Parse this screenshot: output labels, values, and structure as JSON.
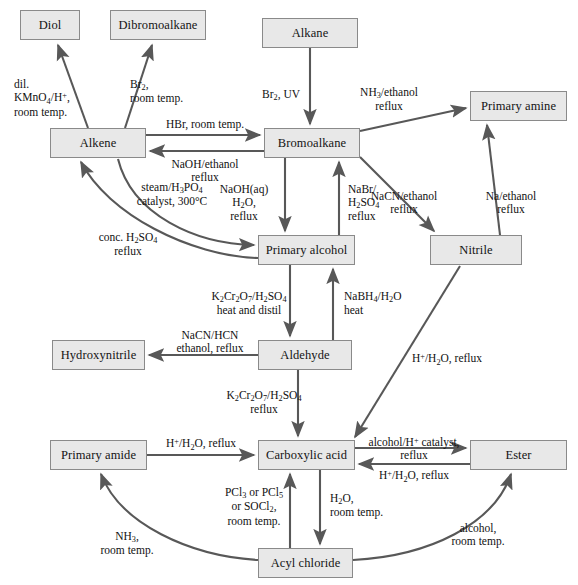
{
  "diagram": {
    "box_fill": "#e8e8e8",
    "box_stroke": "#8a8a8a",
    "arrow_color": "#585858",
    "text_color": "#141414"
  },
  "nodes": [
    {
      "id": "diol",
      "label": "Diol",
      "x": 20,
      "y": 10,
      "w": 60,
      "h": 30
    },
    {
      "id": "dibromoalkane",
      "label": "Dibromoalkane",
      "x": 110,
      "y": 10,
      "w": 96,
      "h": 30
    },
    {
      "id": "alkane",
      "label": "Alkane",
      "x": 262,
      "y": 18,
      "w": 96,
      "h": 30
    },
    {
      "id": "primary-amine",
      "label": "Primary amine",
      "x": 470,
      "y": 91,
      "w": 97,
      "h": 30
    },
    {
      "id": "alkene",
      "label": "Alkene",
      "x": 50,
      "y": 128,
      "w": 96,
      "h": 30
    },
    {
      "id": "bromoalkane",
      "label": "Bromoalkane",
      "x": 264,
      "y": 128,
      "w": 96,
      "h": 30
    },
    {
      "id": "primary-alcohol",
      "label": "Primary alcohol",
      "x": 258,
      "y": 235,
      "w": 97,
      "h": 30
    },
    {
      "id": "nitrile",
      "label": "Nitrile",
      "x": 430,
      "y": 235,
      "w": 92,
      "h": 30
    },
    {
      "id": "hydroxynitrile",
      "label": "Hydroxynitrile",
      "x": 52,
      "y": 340,
      "w": 93,
      "h": 30
    },
    {
      "id": "aldehyde",
      "label": "Aldehyde",
      "x": 258,
      "y": 340,
      "w": 94,
      "h": 30
    },
    {
      "id": "primary-amide",
      "label": "Primary amide",
      "x": 50,
      "y": 440,
      "w": 97,
      "h": 30
    },
    {
      "id": "carboxylic-acid",
      "label": "Carboxylic acid",
      "x": 258,
      "y": 440,
      "w": 97,
      "h": 30
    },
    {
      "id": "ester",
      "label": "Ester",
      "x": 470,
      "y": 440,
      "w": 97,
      "h": 30
    },
    {
      "id": "acyl-chloride",
      "label": "Acyl chloride",
      "x": 258,
      "y": 548,
      "w": 95,
      "h": 30
    }
  ],
  "reactions": [
    {
      "id": "alkene-to-diol",
      "from": "alkene",
      "to": "diol",
      "reagent_lines": [
        "dil.",
        "KMnO4/H+,",
        "room temp."
      ]
    },
    {
      "id": "alkene-to-dibromoalkane",
      "from": "alkene",
      "to": "dibromoalkane",
      "reagent_lines": [
        "Br2,",
        "room temp."
      ]
    },
    {
      "id": "alkane-to-bromoalkane",
      "from": "alkane",
      "to": "bromoalkane",
      "reagent_lines": [
        "Br2, UV"
      ]
    },
    {
      "id": "alkene-to-bromoalkane",
      "from": "alkene",
      "to": "bromoalkane",
      "reagent_lines": [
        "HBr, room temp."
      ]
    },
    {
      "id": "bromoalkane-to-alkene",
      "from": "bromoalkane",
      "to": "alkene",
      "reagent_lines": [
        "NaOH/ethanol",
        "reflux"
      ]
    },
    {
      "id": "bromoalkane-to-amine",
      "from": "bromoalkane",
      "to": "primary-amine",
      "reagent_lines": [
        "NH3/ethanol",
        "reflux"
      ]
    },
    {
      "id": "bromoalkane-to-nitrile",
      "from": "bromoalkane",
      "to": "nitrile",
      "reagent_lines": [
        "NaCN/ethanol",
        "reflux"
      ]
    },
    {
      "id": "nitrile-to-amine",
      "from": "nitrile",
      "to": "primary-amine",
      "reagent_lines": [
        "Na/ethanol",
        "reflux"
      ]
    },
    {
      "id": "bromoalkane-to-alcohol",
      "from": "bromoalkane",
      "to": "primary-alcohol",
      "reagent_lines": [
        "NaOH(aq)",
        "H2O,",
        "reflux"
      ]
    },
    {
      "id": "alcohol-to-bromoalkane",
      "from": "primary-alcohol",
      "to": "bromoalkane",
      "reagent_lines": [
        "NaBr/",
        "H2SO4",
        "reflux"
      ]
    },
    {
      "id": "alcohol-to-alkene",
      "from": "primary-alcohol",
      "to": "alkene",
      "reagent_lines": [
        "conc. H2SO4",
        "reflux"
      ]
    },
    {
      "id": "alkene-to-alcohol",
      "from": "alkene",
      "to": "primary-alcohol",
      "reagent_lines": [
        "steam/H3PO4",
        "catalyst, 300°C"
      ]
    },
    {
      "id": "alcohol-to-aldehyde",
      "from": "primary-alcohol",
      "to": "aldehyde",
      "reagent_lines": [
        "K2Cr2O7/H2SO4",
        "heat and distil"
      ]
    },
    {
      "id": "aldehyde-to-alcohol",
      "from": "aldehyde",
      "to": "primary-alcohol",
      "reagent_lines": [
        "NaBH4/H2O",
        "heat"
      ]
    },
    {
      "id": "aldehyde-to-hydroxynitrile",
      "from": "aldehyde",
      "to": "hydroxynitrile",
      "reagent_lines": [
        "NaCN/HCN",
        "ethanol, reflux"
      ]
    },
    {
      "id": "aldehyde-to-acid",
      "from": "aldehyde",
      "to": "carboxylic-acid",
      "reagent_lines": [
        "K2Cr2O7/H2SO4",
        "reflux"
      ]
    },
    {
      "id": "nitrile-to-acid",
      "from": "nitrile",
      "to": "carboxylic-acid",
      "reagent_lines": [
        "H+/H2O, reflux"
      ]
    },
    {
      "id": "amide-to-acid",
      "from": "primary-amide",
      "to": "carboxylic-acid",
      "reagent_lines": [
        "H+/H2O, reflux"
      ]
    },
    {
      "id": "acid-to-ester",
      "from": "carboxylic-acid",
      "to": "ester",
      "reagent_lines": [
        "alcohol/H+ catalyst,",
        "reflux"
      ]
    },
    {
      "id": "ester-to-acid",
      "from": "ester",
      "to": "carboxylic-acid",
      "reagent_lines": [
        "H+/H2O, reflux"
      ]
    },
    {
      "id": "acid-to-acyl-chloride",
      "from": "carboxylic-acid",
      "to": "acyl-chloride",
      "reagent_lines": [
        "PCl3 or PCl5",
        "or SOCl2,",
        "room temp."
      ]
    },
    {
      "id": "acyl-chloride-to-acid",
      "from": "acyl-chloride",
      "to": "carboxylic-acid",
      "reagent_lines": [
        "H2O,",
        "room temp."
      ]
    },
    {
      "id": "acyl-chloride-to-amide",
      "from": "acyl-chloride",
      "to": "primary-amide",
      "reagent_lines": [
        "NH3,",
        "room temp."
      ]
    },
    {
      "id": "acyl-chloride-to-ester",
      "from": "acyl-chloride",
      "to": "ester",
      "reagent_lines": [
        "alcohol,",
        "room temp."
      ]
    }
  ],
  "labels": {
    "dil_kmno4": {
      "html": "dil.<br>KMnO<sub>4</sub>/H<sup>+</sup>,<br>room temp.",
      "x": 14,
      "y": 78,
      "align": "left"
    },
    "br2_rt": {
      "html": "Br<sub>2</sub>,<br>room temp.",
      "x": 130,
      "y": 78,
      "align": "left"
    },
    "br2_uv": {
      "html": "Br<sub>2</sub>, UV",
      "x": 262,
      "y": 88,
      "align": "left"
    },
    "nh3_ethanol": {
      "html": "NH<sub>3</sub>/ethanol<br>reflux",
      "x": 389,
      "y": 86,
      "align": "center"
    },
    "hbr_rt": {
      "html": "HBr, room temp.",
      "x": 195,
      "y": 119,
      "align": "center"
    },
    "naoh_ethanol": {
      "html": "NaOH/ethanol<br>reflux",
      "x": 194,
      "y": 159,
      "align": "center"
    },
    "nacn_ethanol": {
      "html": "NaCN/ethanol<br>reflux",
      "x": 394,
      "y": 190,
      "align": "center"
    },
    "na_ethanol": {
      "html": "Na/ethanol<br>reflux",
      "x": 501,
      "y": 190,
      "align": "center"
    },
    "naoh_aq": {
      "html": "NaOH(aq)<br>H<sub>2</sub>O,<br>reflux",
      "x": 237,
      "y": 183,
      "align": "center"
    },
    "nabr_h2so4": {
      "html": "NaBr/<br>H<sub>2</sub>SO<sub>4</sub><br>reflux",
      "x": 327,
      "y": 183,
      "align": "left"
    },
    "steam_h3po4": {
      "html": "steam/H<sub>3</sub>PO<sub>4</sub><br>catalyst, 300°C",
      "x": 163,
      "y": 181,
      "align": "center"
    },
    "conc_h2so4": {
      "html": "conc. H<sub>2</sub>SO<sub>4</sub><br>reflux",
      "x": 120,
      "y": 231,
      "align": "center"
    },
    "k2cr2o7_distil": {
      "html": "K<sub>2</sub>Cr<sub>2</sub>O<sub>7</sub>/H<sub>2</sub>SO<sub>4</sub><br>heat and distil",
      "x": 238,
      "y": 290,
      "align": "center"
    },
    "nabh4": {
      "html": "NaBH<sub>4</sub>/H<sub>2</sub>O<br>heat",
      "x": 327,
      "y": 290,
      "align": "left"
    },
    "nacn_hcn": {
      "html": "NaCN/HCN<br>ethanol, reflux",
      "x": 204,
      "y": 330,
      "align": "center"
    },
    "k2cr2o7_reflux": {
      "html": "K<sub>2</sub>Cr<sub>2</sub>O<sub>7</sub>/H<sub>2</sub>SO<sub>4</sub><br>reflux",
      "x": 257,
      "y": 389,
      "align": "center"
    },
    "h_h2o_reflux_nit": {
      "html": "H<sup>+</sup>/H<sub>2</sub>O, reflux",
      "x": 447,
      "y": 352,
      "align": "center"
    },
    "h_h2o_reflux_am": {
      "html": "H<sup>+</sup>/H<sub>2</sub>O, reflux",
      "x": 203,
      "y": 438,
      "align": "center"
    },
    "alcohol_catalyst": {
      "html": "alcohol/H<sup>+</sup> catalyst,<br>reflux",
      "x": 412,
      "y": 437,
      "align": "center"
    },
    "h_h2o_reflux_est": {
      "html": "H<sup>+</sup>/H<sub>2</sub>O, reflux",
      "x": 412,
      "y": 472,
      "align": "center"
    },
    "pcl3_pcl5": {
      "html": "PCl<sub>3</sub> or PCl<sub>5</sub><br>or SOCl<sub>2</sub>,<br>room temp.",
      "x": 246,
      "y": 486,
      "align": "center"
    },
    "h2o_rt": {
      "html": "H<sub>2</sub>O,<br>room temp.",
      "x": 330,
      "y": 492,
      "align": "left"
    },
    "nh3_rt": {
      "html": "NH<sub>3</sub>,<br>room temp.",
      "x": 125,
      "y": 531,
      "align": "center"
    },
    "alcohol_rt": {
      "html": "alcohol,<br>room temp.",
      "x": 470,
      "y": 523,
      "align": "center"
    }
  }
}
